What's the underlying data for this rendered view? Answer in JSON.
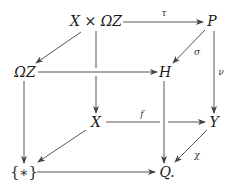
{
  "diagram": {
    "type": "commutative-cube",
    "nodes": {
      "XxOmegaZ": {
        "text": "X × ΩZ",
        "x": 96,
        "y": 21
      },
      "P": {
        "text": "P",
        "x": 212,
        "y": 21
      },
      "OmegaZ": {
        "text": "ΩZ",
        "x": 25,
        "y": 72
      },
      "H": {
        "text": "H",
        "x": 165,
        "y": 72
      },
      "X": {
        "text": "X",
        "x": 96,
        "y": 122
      },
      "Y": {
        "text": "Y",
        "x": 214,
        "y": 122
      },
      "Star": {
        "text": "{∗}",
        "x": 24,
        "y": 172
      },
      "Q": {
        "text": "Q.",
        "x": 166,
        "y": 172
      }
    },
    "labels": {
      "tau": {
        "text": "τ",
        "x": 164,
        "y": 13
      },
      "sigma": {
        "text": "σ",
        "x": 197,
        "y": 52
      },
      "nu": {
        "text": "ν",
        "x": 220,
        "y": 72
      },
      "f": {
        "text": "f",
        "x": 142,
        "y": 114
      },
      "chi": {
        "text": "χ",
        "x": 197,
        "y": 155
      }
    },
    "arrows": [
      {
        "from": "X × ΩZ",
        "to": "P",
        "label": "τ"
      },
      {
        "from": "X × ΩZ",
        "to": "ΩZ",
        "label": ""
      },
      {
        "from": "X × ΩZ",
        "to": "X",
        "label": ""
      },
      {
        "from": "P",
        "to": "H",
        "label": "σ"
      },
      {
        "from": "P",
        "to": "Y",
        "label": "ν"
      },
      {
        "from": "ΩZ",
        "to": "H",
        "label": ""
      },
      {
        "from": "ΩZ",
        "to": "{∗}",
        "label": ""
      },
      {
        "from": "H",
        "to": "Q.",
        "label": ""
      },
      {
        "from": "X",
        "to": "Y",
        "label": "f"
      },
      {
        "from": "X",
        "to": "{∗}",
        "label": ""
      },
      {
        "from": "Y",
        "to": "Q.",
        "label": "χ"
      },
      {
        "from": "{∗}",
        "to": "Q.",
        "label": ""
      }
    ],
    "colors": {
      "line": "#555555",
      "text": "#1a1a1a"
    }
  }
}
